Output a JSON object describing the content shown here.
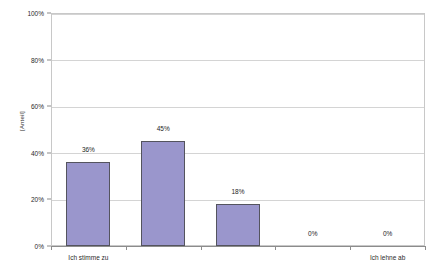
{
  "chart_data": {
    "type": "bar",
    "title": "",
    "subtitle": "",
    "xlabel": "",
    "ylabel": "[Anteil]",
    "categories": [
      "Ich stimme zu",
      "",
      "",
      "",
      "Ich lehne ab"
    ],
    "visible_category_labels": [
      "Ich stimme zu",
      "Ich lehne ab"
    ],
    "values": [
      36,
      45,
      18,
      0,
      0
    ],
    "data_labels": [
      "36%",
      "45%",
      "18%",
      "0%",
      "0%"
    ],
    "ylim": [
      0,
      100
    ],
    "ytick_values": [
      0,
      20,
      40,
      60,
      80,
      100
    ],
    "ytick_labels": [
      "0%",
      "20%",
      "40%",
      "60%",
      "80%",
      "100%"
    ],
    "grid": true,
    "legend": false,
    "legend_position": "none",
    "series": [
      {
        "name": "Anteil",
        "values": [
          36,
          45,
          18,
          0,
          0
        ]
      }
    ],
    "colors": {
      "bar_fill": "#9a96cc",
      "bar_border": "#54545e",
      "gridline": "#d4d4d4",
      "axis": "#8c8c8c",
      "plot_border": "#c8c8c8",
      "background": "#ffffff",
      "text": "#2a2a2a"
    }
  }
}
